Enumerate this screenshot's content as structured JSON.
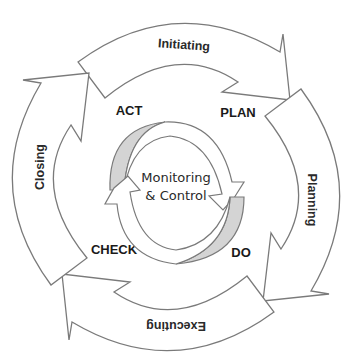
{
  "diagram": {
    "outer_phases": [
      {
        "label": "Initiating",
        "position": "top"
      },
      {
        "label": "Planning",
        "position": "right"
      },
      {
        "label": "Executing",
        "position": "bottom"
      },
      {
        "label": "Closing",
        "position": "left"
      }
    ],
    "pdca": {
      "act": "ACT",
      "plan": "PLAN",
      "do": "DO",
      "check": "CHECK"
    },
    "center": {
      "line1": "Monitoring",
      "line2": "& Control"
    },
    "colors": {
      "stroke": "#7a7a7a",
      "shade": "#d4d4d4",
      "text": "#2a2a2a",
      "background": "#ffffff"
    }
  }
}
